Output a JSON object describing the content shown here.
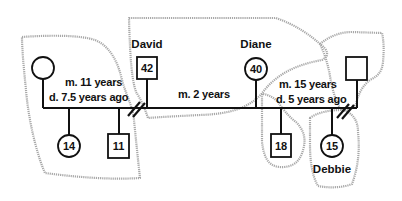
{
  "diagram": {
    "type": "genogram",
    "households": [
      {
        "id": "household-first-marriage",
        "members": [
          "ex-wife",
          "child-14",
          "child-11"
        ]
      },
      {
        "id": "household-david-diane",
        "members": [
          "david",
          "diane"
        ]
      },
      {
        "id": "household-diane-child",
        "members": [
          "child-18"
        ]
      },
      {
        "id": "household-ex-husband",
        "members": [
          "ex-husband"
        ]
      },
      {
        "id": "household-debbie",
        "members": [
          "debbie"
        ]
      }
    ],
    "people": {
      "ex_wife": {
        "sex": "female",
        "age": ""
      },
      "david": {
        "sex": "male",
        "name": "David",
        "age": "42"
      },
      "diane": {
        "sex": "female",
        "name": "Diane",
        "age": "40"
      },
      "ex_husband": {
        "sex": "male",
        "age": ""
      },
      "child_14": {
        "sex": "female",
        "age": "14"
      },
      "child_11": {
        "sex": "male",
        "age": "11"
      },
      "child_18": {
        "sex": "male",
        "age": "18"
      },
      "debbie": {
        "sex": "female",
        "name": "Debbie",
        "age": "15"
      }
    },
    "relationships": {
      "first_marriage": {
        "line1": "m. 11 years",
        "line2": "d. 7.5 years ago",
        "status": "divorced"
      },
      "current_marriage": {
        "line1": "m. 2 years",
        "status": "married"
      },
      "diane_prior_marriage": {
        "line1": "m. 15 years",
        "line2": "d. 5 years ago",
        "status": "divorced"
      }
    }
  }
}
